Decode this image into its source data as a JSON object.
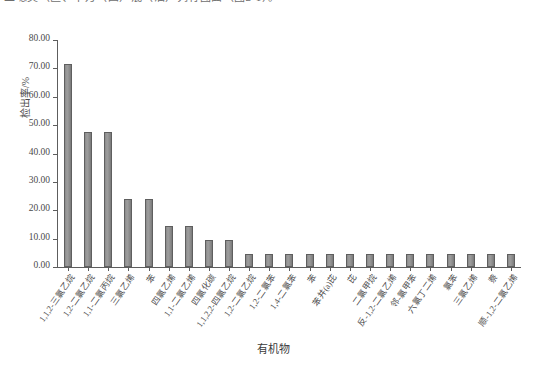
{
  "caption": {
    "text": "二噁英（区、十万（四）混（油）列有图面（图2-1）。"
  },
  "chart_data": {
    "type": "bar",
    "title": "",
    "xlabel": "有机物",
    "ylabel": "检出率/%",
    "ylim": [
      0.0,
      80.0
    ],
    "ytick_step": 10.0,
    "ytick_labels": [
      "0.00",
      "10.00",
      "20.00",
      "30.00",
      "40.00",
      "50.00",
      "60.00",
      "70.00",
      "80.00"
    ],
    "ytick_values": [
      0.0,
      10.0,
      20.0,
      30.0,
      40.0,
      50.0,
      60.0,
      70.0,
      80.0
    ],
    "grid": false,
    "legend": "none",
    "bar_color": "#9a9a9a",
    "bar_edge_color": "#5f5f5f",
    "axis_color": "#5d5d5d",
    "categories": [
      "1,1,2-三氯乙烷",
      "1,2-二氯乙烷",
      "1,1-二氯丙烷",
      "三氯乙烯",
      "苯",
      "四氯乙烯",
      "1,1-二氯乙烯",
      "四氯化碳",
      "1,1,2,2-四氯乙烷",
      "1,2-二氯乙烷",
      "1,2-二氯苯",
      "1,4-二氯苯",
      "苯",
      "苯并(a)芘",
      "芘",
      "二氯甲烷",
      "反-1,2-二氯乙烯",
      "邻-氯甲苯",
      "六氯丁二烯",
      "氯苯",
      "三氯乙烯",
      "萘",
      "顺-1,2-二氯乙烯"
    ],
    "values": [
      71.43,
      47.62,
      47.62,
      23.81,
      23.81,
      14.29,
      14.29,
      9.52,
      9.52,
      4.76,
      4.76,
      4.76,
      4.76,
      4.76,
      4.76,
      4.76,
      4.76,
      4.76,
      4.76,
      4.76,
      4.76,
      4.76,
      4.76
    ]
  }
}
